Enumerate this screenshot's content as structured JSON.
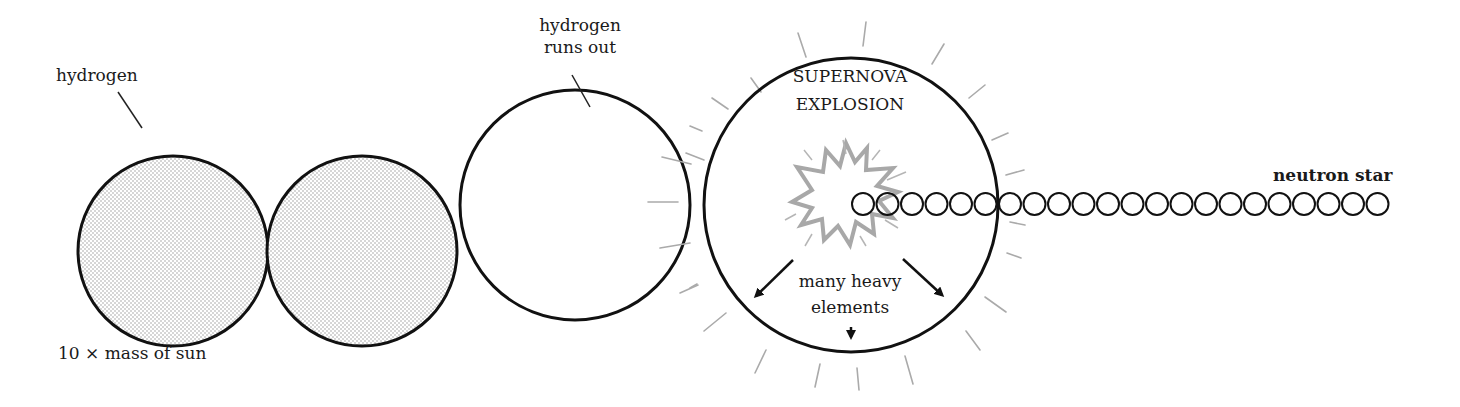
{
  "diagram": {
    "stages": [
      {
        "id": "star-1",
        "label": "hydrogen",
        "fill": "stippled",
        "cx": 173,
        "cy": 251,
        "r": 95
      },
      {
        "id": "star-2",
        "label": "",
        "fill": "stippled",
        "cx": 362,
        "cy": 251,
        "r": 95
      },
      {
        "id": "star-3",
        "label_line1": "hydrogen",
        "label_line2": "runs out",
        "fill": "none",
        "cx": 575,
        "cy": 205,
        "r": 115
      },
      {
        "id": "supernova",
        "label_line1": "SUPERNOVA",
        "label_line2": "EXPLOSION",
        "fill": "none",
        "cx": 851,
        "cy": 205,
        "r": 147
      }
    ],
    "labels": {
      "hydrogen": "hydrogen",
      "hydrogen_runs_out_1": "hydrogen",
      "hydrogen_runs_out_2": "runs out",
      "supernova_1": "SUPERNOVA",
      "supernova_2": "EXPLOSION",
      "heavy_1": "many heavy",
      "heavy_2": "elements",
      "neutron_star": "neutron star",
      "mass": "10 × mass of sun"
    },
    "neutron_chain": {
      "start_x": 863,
      "y": 204,
      "r": 11,
      "spacing": 24.5,
      "count": 22
    },
    "colors": {
      "stroke": "#111111",
      "rays": "#aaaaaa",
      "burst": "#a8a8a8",
      "stipple": "#9a9a9a"
    }
  }
}
